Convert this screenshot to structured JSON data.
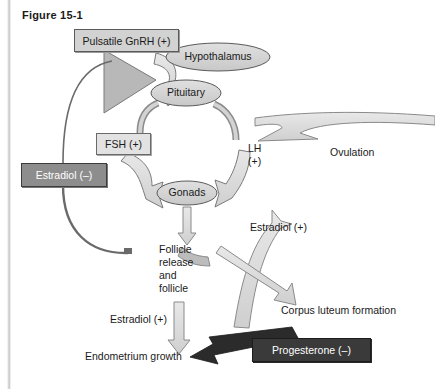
{
  "figure": {
    "title": "Figure 15-1",
    "width": 435,
    "height": 389
  },
  "colors": {
    "background": "#ffffff",
    "text": "#1a1a1a",
    "arrow_fill": "#d8d8d8",
    "arrow_stroke": "#6e6e6e",
    "ellipse_fill": "#d6d6d6",
    "ellipse_stroke": "#5a5a5a",
    "box_gnrh_fill": "#d2d2d2",
    "box_fsh_fill": "#e2e2e2",
    "estradiol_neg_fill": "#8d8d8d",
    "progesterone_neg_fill": "#3a3a3a",
    "inhibit_line": "#555555"
  },
  "boxes": {
    "gnrh": "Pulsatile GnRH (+)",
    "fsh": "FSH (+)",
    "estradiol_negative": "Estradiol (–)",
    "progesterone_negative": "Progesterone (–)"
  },
  "ellipses": {
    "hypothalamus": "Hypothalamus",
    "pituitary": "Pituitary",
    "gonads": "Gonads"
  },
  "labels": {
    "lh": "LH\n(+)",
    "ovulation": "Ovulation",
    "estradiol_positive_lh": "Estradiol (+)",
    "follicle": "Follicle\nrelease\nand\nfollicle",
    "corpus_luteum": "Corpus luteum formation",
    "estradiol_positive_endometrium": "Estradiol (+)",
    "endometrium": "Endometrium growth"
  },
  "diagram_content": {
    "type": "flow-diagram",
    "subject": "Female hypothalamic-pituitary-gonadal axis feedback loop",
    "nodes": [
      {
        "id": "gnrh",
        "label": "Pulsatile GnRH (+)",
        "shape": "rectangle",
        "fill": "light-gray"
      },
      {
        "id": "hypothalamus",
        "label": "Hypothalamus",
        "shape": "ellipse",
        "fill": "gray"
      },
      {
        "id": "pituitary",
        "label": "Pituitary",
        "shape": "ellipse",
        "fill": "gray"
      },
      {
        "id": "fsh",
        "label": "FSH (+)",
        "shape": "rectangle",
        "fill": "light-gray"
      },
      {
        "id": "gonads",
        "label": "Gonads",
        "shape": "ellipse",
        "fill": "gray"
      },
      {
        "id": "estradiol_neg",
        "label": "Estradiol (–)",
        "shape": "rectangle",
        "fill": "medium-gray"
      },
      {
        "id": "lh",
        "label": "LH (+)",
        "shape": "text"
      },
      {
        "id": "ovulation",
        "label": "Ovulation",
        "shape": "text"
      },
      {
        "id": "estradiol_pos_lh",
        "label": "Estradiol (+)",
        "shape": "text"
      },
      {
        "id": "follicle",
        "label": "Follicle release and follicle",
        "shape": "text"
      },
      {
        "id": "corpus_luteum",
        "label": "Corpus luteum formation",
        "shape": "text"
      },
      {
        "id": "estradiol_pos_endo",
        "label": "Estradiol (+)",
        "shape": "text"
      },
      {
        "id": "endometrium",
        "label": "Endometrium growth",
        "shape": "text"
      },
      {
        "id": "progesterone_neg",
        "label": "Progesterone (–)",
        "shape": "rectangle",
        "fill": "dark-gray"
      }
    ],
    "edges": [
      {
        "from": "hypothalamus",
        "to": "pituitary",
        "sign": "+",
        "via": "gnrh"
      },
      {
        "from": "pituitary",
        "to": "gonads",
        "sign": "+",
        "via": "fsh"
      },
      {
        "from": "pituitary",
        "to": "gonads",
        "sign": "+",
        "via": "lh"
      },
      {
        "from": "gonads",
        "to": "follicle",
        "sign": "+"
      },
      {
        "from": "follicle",
        "to": "corpus_luteum",
        "sign": "+",
        "via": "estradiol_pos_lh"
      },
      {
        "from": "follicle",
        "to": "endometrium",
        "sign": "+",
        "via": "estradiol_pos_endo"
      },
      {
        "from": "gonads",
        "to": "ovulation",
        "sign": "+",
        "via": "lh"
      },
      {
        "from": "estradiol_neg",
        "to": "gnrh",
        "sign": "-",
        "type": "negative-feedback"
      },
      {
        "from": "estradiol_neg",
        "to": "follicle",
        "sign": "-",
        "type": "negative-feedback"
      },
      {
        "from": "progesterone_neg",
        "to": "endometrium",
        "sign": "-",
        "type": "negative-feedback"
      }
    ]
  }
}
